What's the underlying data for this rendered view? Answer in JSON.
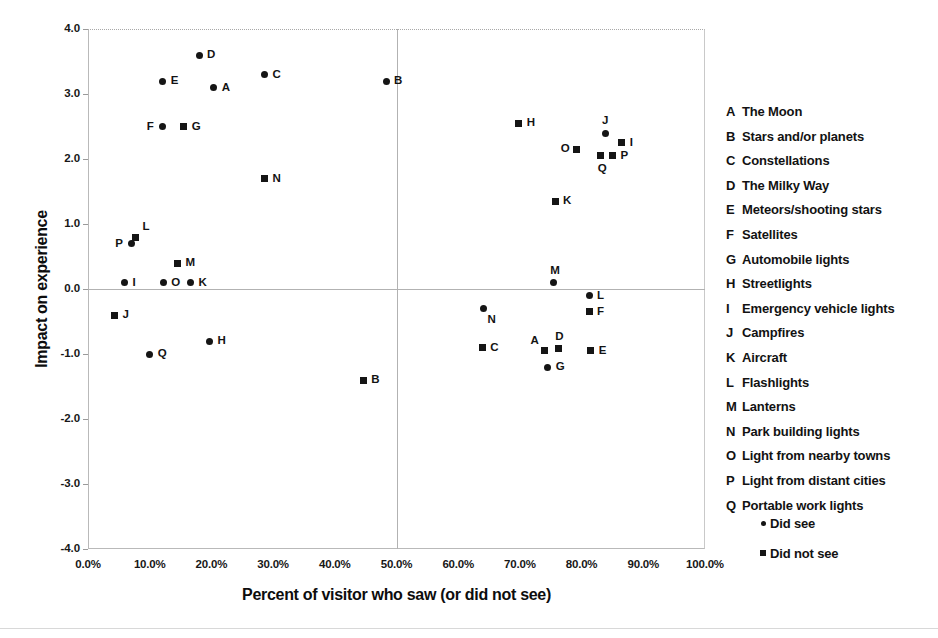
{
  "chart_data": {
    "type": "scatter",
    "title": "",
    "xlabel": "Percent of visitor who saw (or did not see)",
    "ylabel": "Impact on experience",
    "xlim": [
      0,
      100
    ],
    "ylim": [
      -4.0,
      4.0
    ],
    "xticks": [
      "0.0%",
      "10.0%",
      "20.0%",
      "30.0%",
      "40.0%",
      "50.0%",
      "60.0%",
      "70.0%",
      "80.0%",
      "90.0%",
      "100.0%"
    ],
    "xtick_values": [
      0,
      10,
      20,
      30,
      40,
      50,
      60,
      70,
      80,
      90,
      100
    ],
    "yticks": [
      "4.0",
      "3.0",
      "2.0",
      "1.0",
      "0.0",
      "-1.0",
      "-2.0",
      "-3.0",
      "-4.0"
    ],
    "ytick_values": [
      4.0,
      3.0,
      2.0,
      1.0,
      0.0,
      -1.0,
      -2.0,
      -3.0,
      -4.0
    ],
    "grid": false,
    "reference_lines": {
      "vertical_x": 50.0,
      "horizontal_y": 0.0
    },
    "legend_position": "right",
    "series": [
      {
        "name": "Did see",
        "marker": "circle",
        "points": [
          {
            "key": "D",
            "x": 18.0,
            "y": 3.6,
            "label_pos": "right"
          },
          {
            "key": "E",
            "x": 12.1,
            "y": 3.2,
            "label_pos": "right"
          },
          {
            "key": "A",
            "x": 20.4,
            "y": 3.1,
            "label_pos": "right"
          },
          {
            "key": "C",
            "x": 28.6,
            "y": 3.3,
            "label_pos": "right"
          },
          {
            "key": "B",
            "x": 48.3,
            "y": 3.2,
            "label_pos": "right"
          },
          {
            "key": "F",
            "x": 12.1,
            "y": 2.5,
            "label_pos": "left"
          },
          {
            "key": "J",
            "x": 83.8,
            "y": 2.4,
            "label_pos": "above"
          },
          {
            "key": "P",
            "x": 7.0,
            "y": 0.7,
            "label_pos": "left"
          },
          {
            "key": "I",
            "x": 5.9,
            "y": 0.1,
            "label_pos": "right"
          },
          {
            "key": "O",
            "x": 12.2,
            "y": 0.1,
            "label_pos": "right"
          },
          {
            "key": "K",
            "x": 16.6,
            "y": 0.1,
            "label_pos": "right"
          },
          {
            "key": "M",
            "x": 75.4,
            "y": 0.1,
            "label_pos": "above"
          },
          {
            "key": "L",
            "x": 81.2,
            "y": -0.1,
            "label_pos": "right"
          },
          {
            "key": "N",
            "x": 64.1,
            "y": -0.3,
            "label_pos": "below-right"
          },
          {
            "key": "H",
            "x": 19.7,
            "y": -0.8,
            "label_pos": "right"
          },
          {
            "key": "Q",
            "x": 10.0,
            "y": -1.0,
            "label_pos": "right"
          },
          {
            "key": "G",
            "x": 74.5,
            "y": -1.2,
            "label_pos": "right"
          }
        ]
      },
      {
        "name": "Did not see",
        "marker": "square",
        "points": [
          {
            "key": "G",
            "x": 15.5,
            "y": 2.5,
            "label_pos": "right"
          },
          {
            "key": "H",
            "x": 69.8,
            "y": 2.55,
            "label_pos": "right"
          },
          {
            "key": "O",
            "x": 79.2,
            "y": 2.15,
            "label_pos": "left"
          },
          {
            "key": "I",
            "x": 86.5,
            "y": 2.25,
            "label_pos": "right"
          },
          {
            "key": "Q",
            "x": 83.1,
            "y": 2.05,
            "label_pos": "below"
          },
          {
            "key": "P",
            "x": 85.0,
            "y": 2.05,
            "label_pos": "right"
          },
          {
            "key": "N",
            "x": 28.6,
            "y": 1.7,
            "label_pos": "right"
          },
          {
            "key": "K",
            "x": 75.7,
            "y": 1.35,
            "label_pos": "right"
          },
          {
            "key": "L",
            "x": 7.7,
            "y": 0.8,
            "label_pos": "above-right"
          },
          {
            "key": "M",
            "x": 14.5,
            "y": 0.4,
            "label_pos": "right"
          },
          {
            "key": "J",
            "x": 4.3,
            "y": -0.4,
            "label_pos": "right"
          },
          {
            "key": "F",
            "x": 81.2,
            "y": -0.35,
            "label_pos": "right"
          },
          {
            "key": "C",
            "x": 63.9,
            "y": -0.9,
            "label_pos": "right"
          },
          {
            "key": "A",
            "x": 74.0,
            "y": -0.95,
            "label_pos": "above-left"
          },
          {
            "key": "D",
            "x": 76.2,
            "y": -0.92,
            "label_pos": "above"
          },
          {
            "key": "E",
            "x": 81.5,
            "y": -0.95,
            "label_pos": "right"
          },
          {
            "key": "B",
            "x": 44.6,
            "y": -1.4,
            "label_pos": "right"
          }
        ]
      }
    ]
  },
  "legend": {
    "items": [
      {
        "key": "A",
        "desc": "The Moon"
      },
      {
        "key": "B",
        "desc": "Stars and/or planets"
      },
      {
        "key": "C",
        "desc": "Constellations"
      },
      {
        "key": "D",
        "desc": "The Milky Way"
      },
      {
        "key": "E",
        "desc": "Meteors/shooting stars"
      },
      {
        "key": "F",
        "desc": "Satellites"
      },
      {
        "key": "G",
        "desc": "Automobile lights"
      },
      {
        "key": "H",
        "desc": "Streetlights"
      },
      {
        "key": "I",
        "desc": "Emergency vehicle lights"
      },
      {
        "key": "J",
        "desc": "Campfires"
      },
      {
        "key": "K",
        "desc": "Aircraft"
      },
      {
        "key": "L",
        "desc": "Flashlights"
      },
      {
        "key": "M",
        "desc": "Lanterns"
      },
      {
        "key": "N",
        "desc": "Park building lights"
      },
      {
        "key": "O",
        "desc": "Light from nearby towns"
      },
      {
        "key": "P",
        "desc": "Light from distant cities"
      },
      {
        "key": "Q",
        "desc": "Portable work lights"
      }
    ]
  },
  "series_legend": [
    {
      "marker": "circle",
      "label": "Did see"
    },
    {
      "marker": "square",
      "label": "Did not see"
    }
  ],
  "colors": {
    "marker": "#151515",
    "axis": "#b2b2b2",
    "text": "#111111",
    "background": "#ffffff"
  }
}
